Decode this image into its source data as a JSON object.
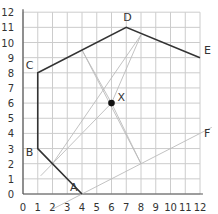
{
  "diagram": {
    "grid": {
      "xmin": 0,
      "xmax": 12,
      "ymin": 0,
      "ymax": 12,
      "step": 1
    },
    "x_ticks": [
      "0",
      "1",
      "2",
      "3",
      "4",
      "5",
      "6",
      "7",
      "8",
      "9",
      "10",
      "11",
      "12"
    ],
    "y_ticks": [
      "0",
      "1",
      "2",
      "3",
      "4",
      "5",
      "6",
      "7",
      "8",
      "9",
      "10",
      "11",
      "12"
    ],
    "points": {
      "A": {
        "label": "A",
        "x": 4,
        "y": 0
      },
      "B": {
        "label": "B",
        "x": 1,
        "y": 3
      },
      "C": {
        "label": "C",
        "x": 1,
        "y": 8
      },
      "D": {
        "label": "D",
        "x": 7,
        "y": 11
      },
      "E": {
        "label": "E",
        "x": 12,
        "y": 9
      },
      "F": {
        "label": "F",
        "x": 12,
        "y": 4
      },
      "X": {
        "label": "X",
        "x": 6,
        "y": 6
      }
    },
    "polyline": [
      "A",
      "B",
      "C",
      "D",
      "E"
    ],
    "colors": {
      "grid": "#cccccc",
      "axis": "#555555",
      "shape": "#333333",
      "construction": "#bbbbbb"
    }
  }
}
